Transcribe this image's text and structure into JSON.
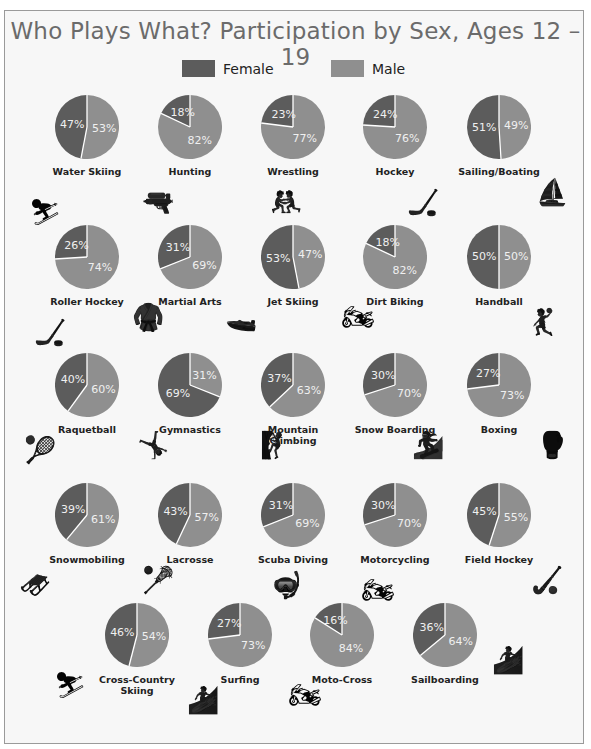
{
  "chart_data": {
    "type": "pie",
    "title": "Who Plays What? Participation by Sex, Ages 12 – 19",
    "legend": [
      {
        "name": "Female",
        "color": "#5c5c5c"
      },
      {
        "name": "Male",
        "color": "#8f8f8f"
      }
    ],
    "legend_position": "top",
    "categories": [
      "Water Skiing",
      "Hunting",
      "Wrestling",
      "Hockey",
      "Sailing/Boating",
      "Roller Hockey",
      "Martial Arts",
      "Jet Skiing",
      "Dirt Biking",
      "Handball",
      "Raquetball",
      "Gymnastics",
      "Mountain Climbing",
      "Snow Boarding",
      "Boxing",
      "Snowmobiling",
      "Lacrosse",
      "Scuba Diving",
      "Motorcycling",
      "Field Hockey",
      "Cross-Country Skiing",
      "Surfing",
      "Moto-Cross",
      "Sailboarding"
    ],
    "series": [
      {
        "name": "Female",
        "values": [
          47,
          18,
          23,
          24,
          51,
          26,
          31,
          53,
          18,
          50,
          40,
          69,
          37,
          30,
          27,
          39,
          43,
          31,
          30,
          45,
          46,
          27,
          16,
          36
        ]
      },
      {
        "name": "Male",
        "values": [
          53,
          82,
          77,
          76,
          49,
          74,
          69,
          47,
          82,
          50,
          60,
          31,
          63,
          70,
          73,
          61,
          57,
          69,
          70,
          55,
          54,
          73,
          84,
          64
        ]
      }
    ],
    "units": "%"
  },
  "title": "Who Plays What? Participation by Sex, Ages 12 – 19",
  "legend": {
    "female": "Female",
    "male": "Male",
    "female_color": "#5c5c5c",
    "male_color": "#8f8f8f"
  },
  "sports": [
    {
      "label": "Water Skiing",
      "female": "47%",
      "male": "53%",
      "icon": "water-skier-icon"
    },
    {
      "label": "Hunting",
      "female": "18%",
      "male": "82%",
      "icon": "hunter-rifle-icon"
    },
    {
      "label": "Wrestling",
      "female": "23%",
      "male": "77%",
      "icon": "wrestlers-icon"
    },
    {
      "label": "Hockey",
      "female": "24%",
      "male": "76%",
      "icon": "hockey-player-icon"
    },
    {
      "label": "Sailing/Boating",
      "female": "51%",
      "male": "49%",
      "icon": "sailboat-icon"
    },
    {
      "label": "Roller Hockey",
      "female": "26%",
      "male": "74%",
      "icon": "hockey-stick-puck-icon"
    },
    {
      "label": "Martial Arts",
      "female": "31%",
      "male": "69%",
      "icon": "martial-arts-kick-icon"
    },
    {
      "label": "Jet Skiing",
      "female": "53%",
      "male": "47%",
      "icon": "jet-ski-icon"
    },
    {
      "label": "Dirt Biking",
      "female": "18%",
      "male": "82%",
      "icon": "dirt-bike-icon"
    },
    {
      "label": "Handball",
      "female": "50%",
      "male": "50%",
      "icon": "handball-player-icon"
    },
    {
      "label": "Raquetball",
      "female": "40%",
      "male": "60%",
      "icon": "raquetball-player-icon"
    },
    {
      "label": "Gymnastics",
      "female": "69%",
      "male": "31%",
      "icon": "gymnast-pommel-icon"
    },
    {
      "label": "Mountain Climbing",
      "female": "37%",
      "male": "63%",
      "icon": "climber-icon"
    },
    {
      "label": "Snow Boarding",
      "female": "30%",
      "male": "70%",
      "icon": "snowboarder-icon"
    },
    {
      "label": "Boxing",
      "female": "27%",
      "male": "73%",
      "icon": "boxer-icon"
    },
    {
      "label": "Snowmobiling",
      "female": "39%",
      "male": "61%",
      "icon": "snowmobile-icon"
    },
    {
      "label": "Lacrosse",
      "female": "43%",
      "male": "57%",
      "icon": "lacrosse-stick-icon"
    },
    {
      "label": "Scuba Diving",
      "female": "31%",
      "male": "69%",
      "icon": "scuba-diver-icon"
    },
    {
      "label": "Motorcycling",
      "female": "30%",
      "male": "70%",
      "icon": "motorcycle-icon"
    },
    {
      "label": "Field Hockey",
      "female": "45%",
      "male": "55%",
      "icon": "field-hockey-stick-icon"
    },
    {
      "label": "Cross-Country\nSkiing",
      "female": "46%",
      "male": "54%",
      "icon": "cross-country-skier-icon"
    },
    {
      "label": "Surfing",
      "female": "27%",
      "male": "73%",
      "icon": "surfboard-icon"
    },
    {
      "label": "Moto-Cross",
      "female": "16%",
      "male": "84%",
      "icon": "motocross-bike-icon"
    },
    {
      "label": "Sailboarding",
      "female": "36%",
      "male": "64%",
      "icon": "windsurfer-icon"
    }
  ]
}
